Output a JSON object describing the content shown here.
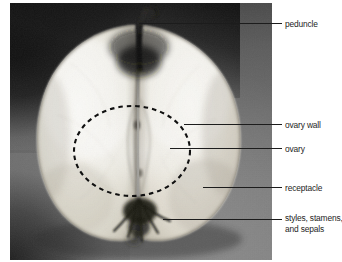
{
  "figure": {
    "kind": "labeled-photograph",
    "background_color": "#ffffff",
    "plate_color": "#6d6d6d"
  },
  "annotations": {
    "leader_line_color": "#1c1c1c",
    "dashed_outline_color": "#111111",
    "labels": [
      {
        "id": "peduncle",
        "text": "peduncle",
        "text2": ""
      },
      {
        "id": "ovary-wall",
        "text": "ovary wall",
        "text2": ""
      },
      {
        "id": "ovary",
        "text": "ovary",
        "text2": ""
      },
      {
        "id": "receptacle",
        "text": "receptacle",
        "text2": ""
      },
      {
        "id": "styles",
        "text": "styles, stamens,",
        "text2": "and sepals"
      }
    ]
  }
}
